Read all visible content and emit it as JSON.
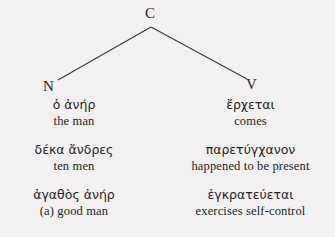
{
  "figure": {
    "type": "syntax-tree-diagram",
    "background_color": "#f2f0f0",
    "text_color": "#221f20",
    "line_color": "#3a3738"
  },
  "tree": {
    "root": {
      "label": "C"
    },
    "branches": [
      {
        "label": "N",
        "side": "left"
      },
      {
        "label": "V",
        "side": "right"
      }
    ]
  },
  "columns": [
    {
      "id": "noun-column",
      "head": "N",
      "entries": [
        {
          "greek": "ὁ ἀνήρ",
          "gloss": "the man"
        },
        {
          "greek": "δέκα ἄνδρες",
          "gloss": "ten men"
        },
        {
          "greek": "ἀγαθὸς ἀνήρ",
          "gloss": "(a) good man"
        }
      ]
    },
    {
      "id": "verb-column",
      "head": "V",
      "entries": [
        {
          "greek": "ἔρχεται",
          "gloss": "comes"
        },
        {
          "greek": "παρετύγχανον",
          "gloss": "happened to be present"
        },
        {
          "greek": "ἐγκρατεύεται",
          "gloss": "exercises self-control"
        }
      ]
    }
  ]
}
